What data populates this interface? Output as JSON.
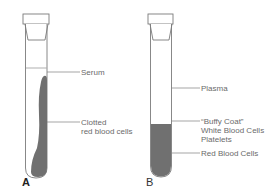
{
  "figure": {
    "panels": [
      {
        "id": "A",
        "label": "A",
        "description": "Clotted blood tube",
        "layers": [
          {
            "name": "Serum",
            "label": "Serum"
          },
          {
            "name": "Clotted red blood cells",
            "label_line1": "Clotted",
            "label_line2": "red blood cells"
          }
        ]
      },
      {
        "id": "B",
        "label": "B",
        "description": "Anticoagulated blood tube",
        "layers": [
          {
            "name": "Plasma",
            "label": "Plasma"
          },
          {
            "name": "Buffy Coat",
            "label_line1": "“Buffy Coat”",
            "label_line2": "White Blood Cells",
            "label_line3": "Platelets"
          },
          {
            "name": "Red Blood Cells",
            "label": "Red Blood Cells"
          }
        ]
      }
    ],
    "colors": {
      "outline": "#7a7a7a",
      "cells": "#707070",
      "leader": "#808080",
      "text": "#6a6a6a"
    }
  }
}
